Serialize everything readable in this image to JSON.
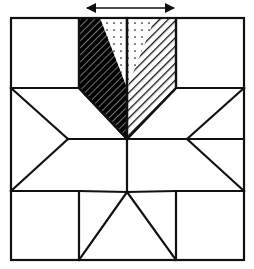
{
  "figure": {
    "canvas": {
      "width": 254,
      "height": 269,
      "background": "#ffffff"
    },
    "stroke_color": "#111111",
    "stroke_width": 2.2,
    "annotation": {
      "arrow": {
        "label": "double-headed-arrow",
        "direction": "horizontal bidirectional",
        "x_start": 85,
        "x_end": 176,
        "y": 8,
        "color": "#111111"
      }
    },
    "outer_square": {
      "left": 11,
      "top": 18,
      "right": 244,
      "bottom": 260
    },
    "center": {
      "x": 127,
      "y": 139
    },
    "star_points": {
      "top": {
        "x": 127,
        "y": 18
      },
      "bottom": {
        "x": 127,
        "y": 260
      },
      "left": {
        "x": 11,
        "y": 139
      },
      "right": {
        "x": 244,
        "y": 139
      },
      "top_left_diag": {
        "x": 11,
        "y": 18
      },
      "top_right_diag": {
        "x": 244,
        "y": 18
      },
      "bottom_left_diag": {
        "x": 11,
        "y": 260
      },
      "bottom_right_diag": {
        "x": 244,
        "y": 260
      }
    },
    "inner_vertices": {
      "left_notch": {
        "x": 68,
        "y": 139
      },
      "right_notch": {
        "x": 187,
        "y": 139
      },
      "bottom_notch": {
        "x": 127,
        "y": 192
      },
      "top_left_corner": {
        "x": 79,
        "y": 88
      },
      "top_right_corner": {
        "x": 176,
        "y": 88
      },
      "bottom_left_corner": {
        "x": 79,
        "y": 191
      },
      "bottom_right_corner": {
        "x": 176,
        "y": 191
      }
    },
    "corner_squares": [
      {
        "name": "top-left-corner-square",
        "left": 11,
        "top": 18,
        "right": 79,
        "bottom": 88,
        "fill": "#ffffff"
      },
      {
        "name": "top-right-corner-square",
        "left": 176,
        "top": 18,
        "right": 244,
        "bottom": 88,
        "fill": "#ffffff"
      },
      {
        "name": "bottom-left-corner-square",
        "left": 11,
        "top": 191,
        "right": 79,
        "bottom": 260,
        "fill": "#ffffff"
      },
      {
        "name": "bottom-right-corner-square",
        "left": 176,
        "top": 191,
        "right": 244,
        "bottom": 260,
        "fill": "#ffffff"
      }
    ],
    "shaded_pieces": [
      {
        "name": "left-dark-hatch-diamond",
        "pattern": "dense-dark-diagonal-hatch",
        "fill_color": "#000000",
        "points": "79,18 127,18 127,139 79,88"
      },
      {
        "name": "center-dotted-triangle",
        "pattern": "dotted-stipple",
        "fill_color": "#ffffff",
        "dot_color": "#111111",
        "points": "100,18 155,18 127,88"
      },
      {
        "name": "right-light-hatch-diamond",
        "pattern": "light-diagonal-hatch",
        "fill_color": "#ffffff",
        "line_color": "#111111",
        "points": "127,18 176,18 176,88 127,139"
      }
    ],
    "plain_pieces": [
      {
        "name": "left-star-ray",
        "points": "11,88 68,139 11,139"
      },
      {
        "name": "left-lower-star-ray",
        "points": "11,139 68,139 11,191"
      },
      {
        "name": "right-star-ray",
        "points": "244,88 187,139 244,139"
      },
      {
        "name": "right-lower-star-ray",
        "points": "244,139 187,139 244,191"
      },
      {
        "name": "bottom-left-star-ray",
        "points": "79,191 127,192 79,260"
      },
      {
        "name": "bottom-right-star-ray",
        "points": "176,191 127,192 176,260"
      },
      {
        "name": "upper-left-kite",
        "points": "11,88 79,88 127,139 68,139"
      },
      {
        "name": "upper-right-kite",
        "points": "244,88 176,88 127,139 187,139"
      },
      {
        "name": "lower-left-kite",
        "points": "11,191 79,191 127,192 68,139"
      },
      {
        "name": "lower-right-kite",
        "points": "244,191 176,191 127,192 187,139"
      },
      {
        "name": "bottom-center-wedge",
        "points": "127,192 176,260 79,260"
      }
    ]
  }
}
